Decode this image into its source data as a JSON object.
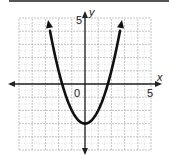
{
  "chart_data": {
    "type": "line",
    "title": "",
    "xlabel": "x",
    "ylabel": "y",
    "xlim": [
      -5,
      5
    ],
    "ylim": [
      -5,
      5
    ],
    "grid": true,
    "tick_labels": {
      "x_max": "5",
      "y_max": "5",
      "origin": "0"
    },
    "series": [
      {
        "name": "parabola",
        "equation": "y = x^2 - 3",
        "vertex": [
          0,
          -3
        ],
        "x_intercepts": [
          -1.73,
          1.73
        ],
        "x": [
          -2.8,
          -2,
          -1.73,
          -1,
          0,
          1,
          1.73,
          2,
          2.8
        ],
        "y": [
          4.84,
          1,
          0,
          -2,
          -3,
          -2,
          0,
          1,
          4.84
        ],
        "arrows_at_ends": true
      }
    ]
  },
  "labels": {
    "x_axis": "x",
    "y_axis": "y",
    "x_max": "5",
    "y_max": "5",
    "origin": "0"
  },
  "colors": {
    "curve": "#111111",
    "axis": "#222222",
    "grid_major": "#b5b5b5",
    "grid_minor": "#cfcfcf",
    "topbar": "#555555"
  }
}
